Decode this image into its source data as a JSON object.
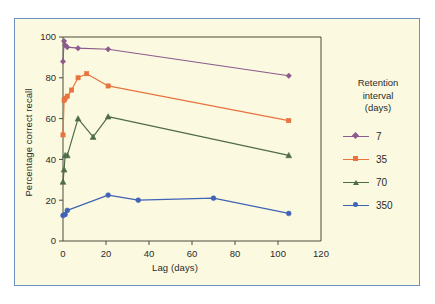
{
  "figure": {
    "background_color": "#fbfae0",
    "border_color": "#6f8fc0"
  },
  "legend": {
    "title_line1": "Retention",
    "title_line2": "interval",
    "title_line3": "(days)",
    "items": [
      {
        "label": "7",
        "color": "#8c5a8c",
        "marker": "diamond"
      },
      {
        "label": "35",
        "color": "#e8733f",
        "marker": "square"
      },
      {
        "label": "70",
        "color": "#4f6b4a",
        "marker": "triangle"
      },
      {
        "label": "350",
        "color": "#3f63b5",
        "marker": "circle"
      }
    ]
  },
  "chart_data": {
    "type": "line",
    "title": "",
    "xlabel": "Lag (days)",
    "ylabel": "Percentage correct recall",
    "xlim": [
      0,
      120
    ],
    "ylim": [
      0,
      100
    ],
    "xticks": [
      0,
      20,
      40,
      60,
      80,
      100,
      120
    ],
    "yticks": [
      0,
      20,
      40,
      60,
      80,
      100
    ],
    "grid": false,
    "legend_position": "right",
    "legend_title": "Retention interval (days)",
    "series": [
      {
        "name": "7",
        "color": "#8c5a8c",
        "marker": "diamond",
        "x": [
          0,
          0.5,
          1,
          2,
          7,
          21,
          105
        ],
        "y": [
          88,
          98,
          96,
          95,
          94.5,
          94,
          81
        ]
      },
      {
        "name": "35",
        "color": "#e8733f",
        "marker": "square",
        "x": [
          0,
          0.5,
          1,
          2,
          4,
          7,
          11,
          21,
          105
        ],
        "y": [
          52,
          69,
          70,
          71,
          74,
          80,
          82,
          76,
          59
        ]
      },
      {
        "name": "70",
        "color": "#4f6b4a",
        "marker": "triangle",
        "x": [
          0,
          0.5,
          1,
          2,
          7,
          14,
          21,
          105
        ],
        "y": [
          29,
          35,
          42,
          42,
          60,
          51,
          61,
          42
        ]
      },
      {
        "name": "350",
        "color": "#3f63b5",
        "marker": "circle",
        "x": [
          0,
          1,
          2,
          21,
          35,
          70,
          105
        ],
        "y": [
          12.5,
          13,
          15,
          22.5,
          20,
          21,
          13.5
        ]
      }
    ]
  }
}
